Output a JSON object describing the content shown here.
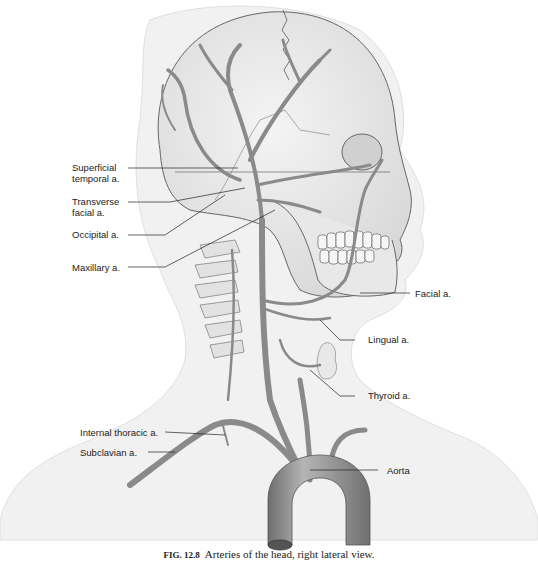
{
  "figure": {
    "caption_number": "FIG. 12.8",
    "caption_text": "Arteries of the head, right lateral view.",
    "labels": {
      "superficial_temporal_line1": "Superficial",
      "superficial_temporal_line2": "temporal a.",
      "transverse_facial_line1": "Transverse",
      "transverse_facial_line2": "facial a.",
      "occipital": "Occipital a.",
      "maxillary": "Maxillary a.",
      "facial": "Facial a.",
      "lingual": "Lingual a.",
      "thyroid": "Thyroid a.",
      "internal_thoracic": "Internal thoracic a.",
      "subclavian": "Subclavian a.",
      "aorta": "Aorta"
    },
    "colors": {
      "background": "#ffffff",
      "body_silhouette": "#f1f1f1",
      "skull": "#e6e6e6",
      "artery": "#8a8a8a",
      "outline": "#555555"
    }
  }
}
